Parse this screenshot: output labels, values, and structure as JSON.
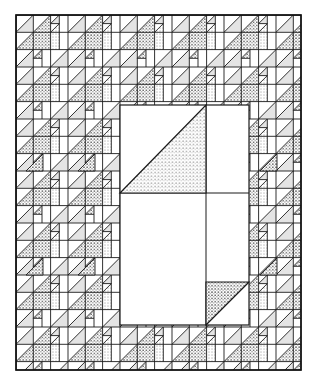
{
  "figure": {
    "description": "Quilt pattern line drawing with repeating half-square-triangle border blocks around a large central panel",
    "quilt_bounds": {
      "x": 16,
      "y": 15,
      "width": 285,
      "height": 355
    },
    "center_panel": {
      "x": 120,
      "y": 105,
      "width": 129,
      "height": 220,
      "divider_x": 206,
      "divider_y": 193
    },
    "block_size": 52,
    "colors": {
      "line": "#1a1a1a",
      "light_fill": "#e4e4e4",
      "stipple_dot": "#222222",
      "background": "#ffffff"
    },
    "fills": [
      "plain",
      "light-gray",
      "stipple-fine",
      "stipple-coarse"
    ]
  }
}
